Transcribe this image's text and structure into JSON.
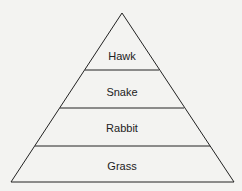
{
  "diagram": {
    "type": "food-pyramid",
    "levels": [
      {
        "label": "Hawk"
      },
      {
        "label": "Snake"
      },
      {
        "label": "Rabbit"
      },
      {
        "label": "Grass"
      }
    ],
    "colors": {
      "background": "#f3f3f1",
      "stroke": "#222222"
    }
  }
}
